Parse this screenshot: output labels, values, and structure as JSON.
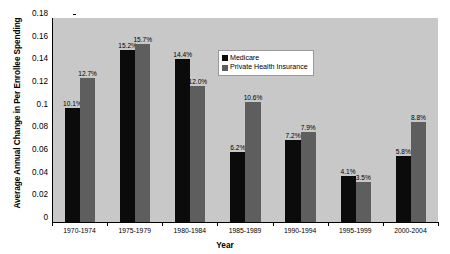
{
  "chart_data": {
    "type": "bar",
    "title": "",
    "xlabel": "Year",
    "ylabel": "Average Annual Change in Per Enrollee Spending",
    "ylim": [
      0,
      0.18
    ],
    "ytick_values": [
      0,
      0.02,
      0.04,
      0.06,
      0.08,
      0.1,
      0.12,
      0.14,
      0.16,
      0.18
    ],
    "ytick_labels": [
      "0",
      "0.02",
      "0.04",
      "0.06",
      "0.08",
      "0.1",
      "0.12",
      "0.14",
      "0.16",
      "0.18"
    ],
    "grid": false,
    "legend_position": "top-center",
    "plot_background": "#c8c8c8",
    "categories": [
      "1970-1974",
      "1975-1979",
      "1980-1984",
      "1985-1989",
      "1990-1994",
      "1995-1999",
      "2000-2004"
    ],
    "series": [
      {
        "name": "Medicare",
        "color": "#0b0b0b",
        "values": [
          0.101,
          0.152,
          0.144,
          0.062,
          0.072,
          0.041,
          0.058
        ],
        "labels": [
          "10.1%",
          "15.2%",
          "14.4%",
          "6.2%",
          "7.2%",
          "4.1%",
          "5.8%"
        ]
      },
      {
        "name": "Private Health Insurance",
        "color": "#5e5e5e",
        "values": [
          0.127,
          0.157,
          0.12,
          0.106,
          0.079,
          0.035,
          0.088
        ],
        "labels": [
          "12.7%",
          "15.7%",
          "12.0%",
          "10.6%",
          "7.9%",
          "3.5%",
          "8.8%"
        ]
      }
    ]
  },
  "legend": {
    "items": [
      {
        "label": "Medicare",
        "swatch": "medicare"
      },
      {
        "label": "Private Health Insurance",
        "swatch": "private"
      }
    ]
  }
}
